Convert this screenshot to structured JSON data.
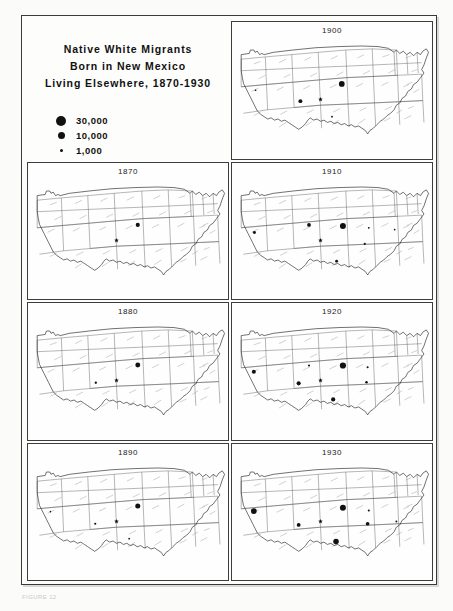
{
  "figure": {
    "title_lines": [
      "Native White Migrants",
      "Born in New Mexico",
      "Living Elsewhere, 1870-1930"
    ],
    "caption": "FIGURE 12",
    "origin_state": "New Mexico",
    "origin_marker": "star"
  },
  "legend": {
    "entries": [
      {
        "label": "30,000",
        "value": 30000,
        "dot_px": 10
      },
      {
        "label": "10,000",
        "value": 10000,
        "dot_px": 7
      },
      {
        "label": "1,000",
        "value": 1000,
        "dot_px": 3
      }
    ]
  },
  "colors": {
    "ink": "#111111",
    "state_border": "#4a4a4a",
    "coast": "#1e1e1e",
    "paper": "#fdfdfc",
    "frame": "#3a3a3a"
  },
  "chart_data": {
    "type": "map",
    "title": "Native White Migrants Born in New Mexico Living Elsewhere, 1870-1930",
    "subtitle": "",
    "xlabel": "",
    "ylabel": "",
    "legend_position": "top-left",
    "grid": false,
    "value_unit": "persons",
    "symbol_scale": [
      {
        "label": "30,000",
        "value": 30000,
        "radius_px": 5.0
      },
      {
        "label": "10,000",
        "value": 10000,
        "radius_px": 3.5
      },
      {
        "label": "1,000",
        "value": 1000,
        "radius_px": 1.5
      }
    ],
    "panels": [
      {
        "year": "1900",
        "cell": "r1c2",
        "points": [
          {
            "state": "Colorado",
            "x": 205,
            "y": 95,
            "r": 5.0,
            "value": 30000
          },
          {
            "state": "Arizona",
            "x": 133,
            "y": 125,
            "r": 3.4,
            "value": 10000
          },
          {
            "state": "California",
            "x": 55,
            "y": 106,
            "r": 1.5,
            "value": 1000
          },
          {
            "state": "Texas",
            "x": 188,
            "y": 152,
            "r": 1.6,
            "value": 1000
          }
        ]
      },
      {
        "year": "1870",
        "cell": "r2c1",
        "points": [
          {
            "state": "Colorado",
            "x": 205,
            "y": 95,
            "r": 3.6,
            "value": 10000
          }
        ]
      },
      {
        "year": "1910",
        "cell": "r2c2",
        "points": [
          {
            "state": "Colorado",
            "x": 207,
            "y": 97,
            "r": 5.2,
            "value": 30000
          },
          {
            "state": "Utah",
            "x": 148,
            "y": 95,
            "r": 3.3,
            "value": 10000
          },
          {
            "state": "California",
            "x": 53,
            "y": 108,
            "r": 2.6,
            "value": 5000
          },
          {
            "state": "Kansas",
            "x": 252,
            "y": 100,
            "r": 1.6,
            "value": 1000
          },
          {
            "state": "Missouri",
            "x": 297,
            "y": 103,
            "r": 1.5,
            "value": 1000
          },
          {
            "state": "Oklahoma",
            "x": 245,
            "y": 128,
            "r": 1.8,
            "value": 1500
          },
          {
            "state": "Texas",
            "x": 196,
            "y": 158,
            "r": 2.4,
            "value": 3000
          }
        ]
      },
      {
        "year": "1880",
        "cell": "r3c1",
        "points": [
          {
            "state": "Colorado",
            "x": 205,
            "y": 95,
            "r": 4.3,
            "value": 15000
          },
          {
            "state": "Arizona",
            "x": 132,
            "y": 126,
            "r": 2.0,
            "value": 2000
          }
        ]
      },
      {
        "year": "1920",
        "cell": "r3c2",
        "points": [
          {
            "state": "Colorado",
            "x": 207,
            "y": 96,
            "r": 5.4,
            "value": 30000
          },
          {
            "state": "California",
            "x": 52,
            "y": 107,
            "r": 3.5,
            "value": 10000
          },
          {
            "state": "Arizona",
            "x": 130,
            "y": 127,
            "r": 3.6,
            "value": 10000
          },
          {
            "state": "Texas",
            "x": 190,
            "y": 155,
            "r": 3.7,
            "value": 10000
          },
          {
            "state": "Utah",
            "x": 148,
            "y": 96,
            "r": 1.8,
            "value": 1500
          },
          {
            "state": "Kansas",
            "x": 250,
            "y": 99,
            "r": 1.8,
            "value": 1500
          },
          {
            "state": "Oklahoma",
            "x": 248,
            "y": 125,
            "r": 2.2,
            "value": 2500
          }
        ]
      },
      {
        "year": "1890",
        "cell": "r4c1",
        "points": [
          {
            "state": "Colorado",
            "x": 205,
            "y": 95,
            "r": 4.4,
            "value": 15000
          },
          {
            "state": "Arizona",
            "x": 131,
            "y": 126,
            "r": 1.9,
            "value": 2000
          },
          {
            "state": "California",
            "x": 53,
            "y": 105,
            "r": 1.4,
            "value": 1000
          },
          {
            "state": "Texas",
            "x": 190,
            "y": 152,
            "r": 1.5,
            "value": 1000
          }
        ]
      },
      {
        "year": "1930",
        "cell": "r4c2",
        "points": [
          {
            "state": "California",
            "x": 52,
            "y": 104,
            "r": 5.0,
            "value": 30000
          },
          {
            "state": "Colorado",
            "x": 207,
            "y": 98,
            "r": 5.2,
            "value": 30000
          },
          {
            "state": "Texas",
            "x": 195,
            "y": 157,
            "r": 4.8,
            "value": 28000
          },
          {
            "state": "Arizona",
            "x": 130,
            "y": 128,
            "r": 3.3,
            "value": 10000
          },
          {
            "state": "Oklahoma",
            "x": 250,
            "y": 126,
            "r": 3.2,
            "value": 10000
          },
          {
            "state": "Kansas",
            "x": 252,
            "y": 103,
            "r": 1.8,
            "value": 1500
          },
          {
            "state": "Missouri",
            "x": 300,
            "y": 122,
            "r": 1.7,
            "value": 1500
          }
        ]
      }
    ]
  }
}
